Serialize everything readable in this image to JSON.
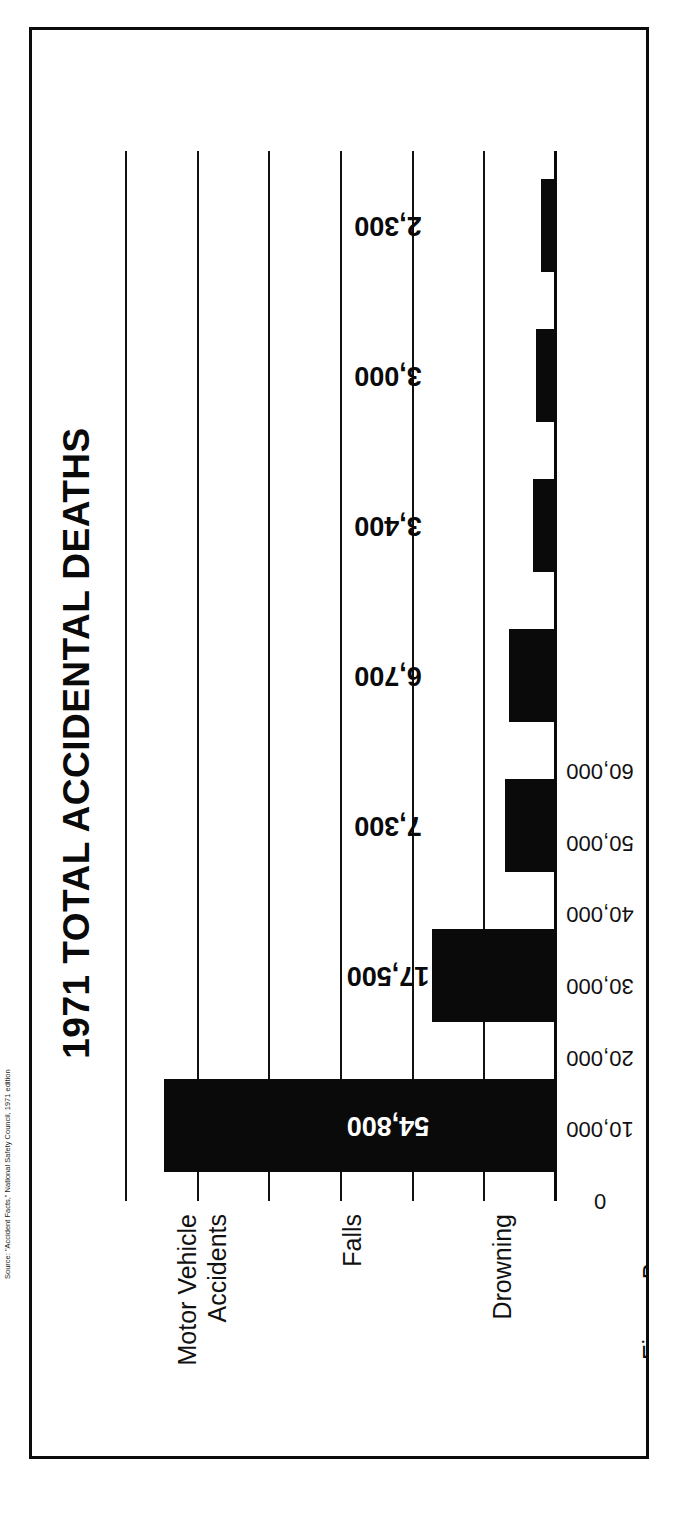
{
  "figure": {
    "source_note": "Source: \"Accident Facts,\" National Safety Council, 1971 edition"
  },
  "chart_data": {
    "type": "bar",
    "title": "1971 TOTAL ACCIDENTAL DEATHS",
    "xlabel": "",
    "ylabel": "",
    "orientation": "vertical (figure printed rotated 90°)",
    "grid": true,
    "legend": "none",
    "ylim": [
      0,
      60000
    ],
    "yticks": [
      0,
      10000,
      20000,
      30000,
      40000,
      50000,
      60000
    ],
    "ytick_labels": [
      "0",
      "10,000",
      "20,000",
      "30,000",
      "40,000",
      "50,000",
      "60,000"
    ],
    "categories": [
      "Motor Vehicle Accidents",
      "Falls",
      "Drowning",
      "Fires—Burns",
      "Suffocation—Ingested Objects",
      "Poison",
      "Firearms"
    ],
    "category_lines": [
      [
        "Motor Vehicle",
        "Accidents"
      ],
      [
        "Falls"
      ],
      [
        "Drowning"
      ],
      [
        "Fires—Burns"
      ],
      [
        "Suffocation—",
        "Ingested Objects"
      ],
      [
        "Poison"
      ],
      [
        "Firearms"
      ]
    ],
    "values": [
      54800,
      17500,
      7300,
      6700,
      3400,
      3000,
      2300
    ],
    "value_labels": [
      "54,800",
      "17,500",
      "7,300",
      "6,700",
      "3,400",
      "3,000",
      "2,300"
    ],
    "colors": {
      "bar": "#0a0a0a",
      "grid": "#111111",
      "axis": "#0a0a0a",
      "text": "#0a0a0a",
      "background": "#ffffff"
    }
  }
}
